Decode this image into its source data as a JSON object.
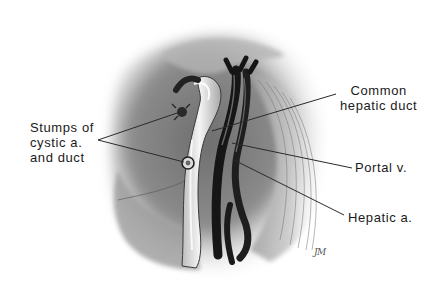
{
  "figure": {
    "style": "grayscale pencil/airbrush medical illustration",
    "background": "#ffffff"
  },
  "labels": {
    "stumps": {
      "lines": [
        "Stumps of",
        "cystic a.",
        "and duct"
      ]
    },
    "common_hepatic_duct": {
      "lines": [
        "Common",
        "hepatic duct"
      ]
    },
    "portal_vein": {
      "text": "Portal v."
    },
    "hepatic_artery": {
      "text": "Hepatic a."
    }
  },
  "signature": {
    "text": "JM"
  },
  "colors": {
    "text": "#1a1a1a",
    "leader_line": "#2a2a2a",
    "duct": "#e9e9e9",
    "vessel_dark": "#1c1c1c",
    "tissue_mid": "#8a8a8a",
    "tissue_light": "#c8c8c8"
  }
}
